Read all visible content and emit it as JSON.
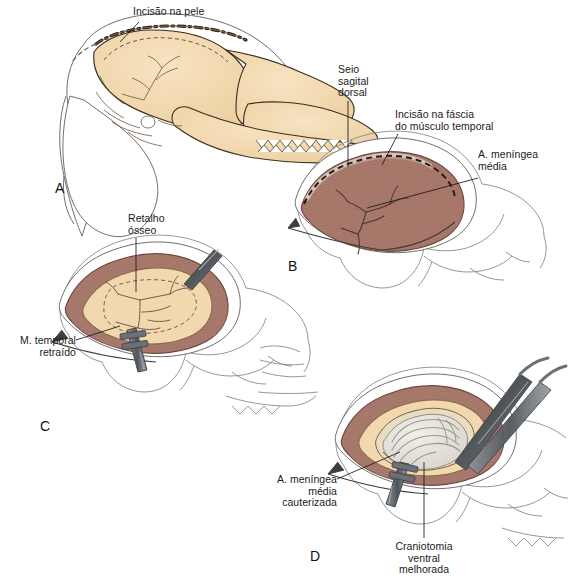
{
  "figure": {
    "width": 570,
    "height": 583,
    "background_color": "#ffffff"
  },
  "palette": {
    "bone": "#f2d8ae",
    "bone_shadow": "#e3c18d",
    "bone_outline": "#3b2f22",
    "muscle": "#a9796c",
    "muscle_dark": "#8b5c50",
    "muscle_light": "#c49a8c",
    "muscle_striation": "#7d5145",
    "skin_outline": "#6b6b6b",
    "brain": "#e7e4de",
    "brain_line": "#9a968e",
    "steel_dark": "#4f5459",
    "steel_mid": "#797f85",
    "steel_light": "#a9aeb3",
    "vessel": "#5a4436",
    "incision_dash": "#2a211a",
    "text": "#1a1a1a"
  },
  "panels": [
    {
      "id": "A",
      "letter": "A",
      "letter_pos": {
        "x": 55,
        "y": 180
      },
      "caption": "Crânio em vista lateral com a linha de incisão da pele marcada sobre a crista sagital",
      "labels": [
        {
          "name": "skin-incision",
          "lines": [
            "Incisão na pele"
          ],
          "align": "left",
          "x": 133,
          "y": 6,
          "leader": {
            "from": {
              "x": 139,
              "y": 22
            },
            "to": {
              "x": 120,
              "y": 42
            }
          }
        }
      ]
    },
    {
      "id": "B",
      "letter": "B",
      "letter_pos": {
        "x": 288,
        "y": 258
      },
      "caption": "Músculo temporal exposto com o seio sagital dorsal e a artéria meníngea média indicados",
      "labels": [
        {
          "name": "dorsal-sagittal-sinus",
          "lines": [
            "Seio",
            "sagital",
            "dorsal"
          ],
          "align": "left",
          "x": 338,
          "y": 64,
          "leader": {
            "from": {
              "x": 348,
              "y": 101
            },
            "to": {
              "x": 348,
              "y": 167
            }
          }
        },
        {
          "name": "temporal-fascia-incision",
          "lines": [
            "Incisão na fáscia",
            "do músculo temporal"
          ],
          "align": "left",
          "x": 395,
          "y": 109,
          "leader": {
            "from": {
              "x": 398,
              "y": 134
            },
            "to": {
              "x": 382,
              "y": 165
            }
          }
        },
        {
          "name": "middle-meningeal-artery",
          "lines": [
            "A. meníngea",
            "média"
          ],
          "align": "left",
          "x": 478,
          "y": 149,
          "leader": {
            "from": {
              "x": 478,
              "y": 178
            },
            "to": {
              "x": 367,
              "y": 208
            }
          }
        }
      ]
    },
    {
      "id": "C",
      "letter": "C",
      "letter_pos": {
        "x": 40,
        "y": 418
      },
      "caption": "Retalho ósseo removido expondo a dura-máter, com o músculo temporal retraído",
      "labels": [
        {
          "name": "bone-flap",
          "lines": [
            "Retalho",
            "ósseo"
          ],
          "align": "left",
          "x": 128,
          "y": 213,
          "leader": {
            "from": {
              "x": 136,
              "y": 238
            },
            "to": {
              "x": 136,
              "y": 292
            }
          }
        },
        {
          "name": "retracted-temporal-muscle",
          "lines": [
            "M. temporal",
            "retraído"
          ],
          "align": "right",
          "x": 8,
          "y": 335,
          "leader": {
            "from": {
              "x": 76,
              "y": 340
            },
            "to": {
              "x": 120,
              "y": 326
            }
          }
        }
      ]
    },
    {
      "id": "D",
      "letter": "D",
      "letter_pos": {
        "x": 310,
        "y": 548
      },
      "caption": "Craniotomia ventral ampliada com artéria meníngea média cauterizada e encéfalo exposto",
      "labels": [
        {
          "name": "cauterized-middle-meningeal-artery",
          "lines": [
            "A. meníngea",
            "média",
            "cauterizada"
          ],
          "align": "right",
          "x": 195,
          "y": 474,
          "leader": {
            "from": {
              "x": 337,
              "y": 479
            },
            "to": {
              "x": 400,
              "y": 452
            }
          }
        },
        {
          "name": "improved-ventral-craniotomy",
          "lines": [
            "Craniotomia",
            "ventral",
            "melhorada"
          ],
          "align": "center",
          "x": 383,
          "y": 541,
          "leader": {
            "from": {
              "x": 424,
              "y": 538
            },
            "to": {
              "x": 424,
              "y": 462
            }
          }
        }
      ]
    }
  ]
}
